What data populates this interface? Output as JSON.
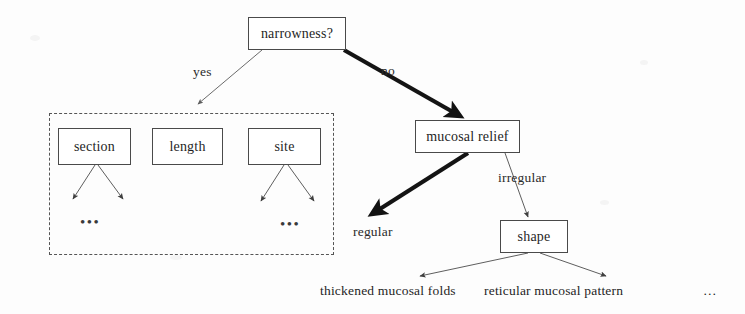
{
  "diagram": {
    "type": "decision-tree",
    "nodes": {
      "root": {
        "label": "narrowness?",
        "x": 248,
        "y": 17,
        "w": 98,
        "h": 33
      },
      "section": {
        "label": "section",
        "x": 58,
        "y": 128,
        "w": 73,
        "h": 37
      },
      "length": {
        "label": "length",
        "x": 152,
        "y": 128,
        "w": 71,
        "h": 37
      },
      "site": {
        "label": "site",
        "x": 248,
        "y": 128,
        "w": 73,
        "h": 37
      },
      "mucosal_relief": {
        "label": "mucosal relief",
        "x": 415,
        "y": 120,
        "w": 105,
        "h": 33
      },
      "shape": {
        "label": "shape",
        "x": 500,
        "y": 220,
        "w": 68,
        "h": 33
      }
    },
    "edge_labels": {
      "yes": {
        "text": "yes",
        "x": 193,
        "y": 64
      },
      "no": {
        "text": "no",
        "x": 381,
        "y": 63
      },
      "regular": {
        "text": "regular",
        "x": 353,
        "y": 224
      },
      "irregular": {
        "text": "irregular",
        "x": 498,
        "y": 170
      }
    },
    "leaf_labels": {
      "thickened_mucosal_folds": {
        "text": "thickened mucosal folds",
        "x": 320,
        "y": 283
      },
      "reticular_mucosal_pattern": {
        "text": "reticular mucosal pattern",
        "x": 484,
        "y": 283
      },
      "more_leaves": {
        "text": "…",
        "x": 703,
        "y": 283
      }
    },
    "ellipses": {
      "section_children": {
        "text": "•••",
        "x": 80,
        "y": 214
      },
      "site_children": {
        "text": "•••",
        "x": 280,
        "y": 216
      }
    },
    "group_frame": {
      "name": "narrowness-attributes-group",
      "x": 49,
      "y": 113,
      "w": 285,
      "h": 142
    },
    "colors": {
      "background": "#fdfdfd",
      "stroke": "#4a4a4a",
      "text": "#1f1f1f",
      "thick_edge": "#1a1a1a",
      "thin_edge": "#6b6b6b",
      "group_border": "#555555"
    }
  }
}
